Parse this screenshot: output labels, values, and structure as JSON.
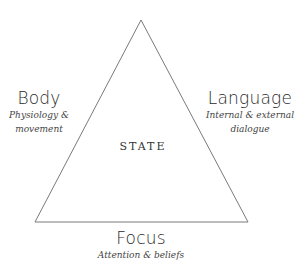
{
  "center": {
    "label": "STATE"
  },
  "nodes": {
    "body": {
      "title": "Body",
      "subtitle_line1": "Physiology &",
      "subtitle_line2": "movement"
    },
    "language": {
      "title": "Language",
      "subtitle_line1": "Internal & external",
      "subtitle_line2": "dialogue"
    },
    "focus": {
      "title": "Focus",
      "subtitle_line1": "Attention & beliefs"
    }
  },
  "colors": {
    "line": "#777777",
    "text": "#2a2a2a"
  }
}
